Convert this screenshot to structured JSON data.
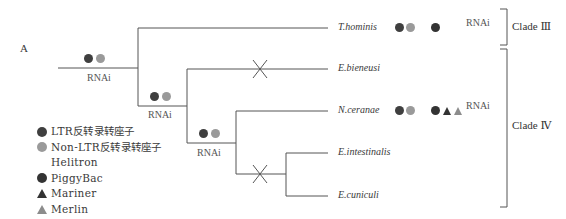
{
  "panel_label": "A",
  "colors": {
    "ltr": "#3f3f3f",
    "non_ltr": "#9a9a9a",
    "piggybac": "#333333",
    "mariner": "#333333",
    "merlin": "#8c8c8c",
    "line": "#555555"
  },
  "taxa": [
    {
      "name": "T.hominis",
      "markers": [
        "ltr",
        "non_ltr",
        "gap",
        "piggybac"
      ],
      "rnai": "RNAi"
    },
    {
      "name": "E.bieneusi",
      "markers": [],
      "rnai": ""
    },
    {
      "name": "N.ceranae",
      "markers": [
        "ltr",
        "non_ltr",
        "gap",
        "piggybac",
        "mariner",
        "merlin"
      ],
      "rnai": "RNAi"
    },
    {
      "name": "E.intestinalis",
      "markers": [],
      "rnai": ""
    },
    {
      "name": "E.cuniculi",
      "markers": [],
      "rnai": ""
    }
  ],
  "internal_nodes": [
    {
      "id": "root-stem",
      "markers": [
        "ltr",
        "non_ltr"
      ],
      "label": "RNAi"
    },
    {
      "id": "node-2",
      "markers": [
        "ltr",
        "non_ltr"
      ],
      "label": "RNAi"
    },
    {
      "id": "node-3",
      "markers": [
        "ltr",
        "non_ltr"
      ],
      "label": "RNAi"
    }
  ],
  "loss_marks": [
    "E.bieneusi branch",
    "E.intestinalis/E.cuniculi branch"
  ],
  "clades": [
    {
      "label": "Clade Ⅲ",
      "members": [
        "T.hominis"
      ]
    },
    {
      "label": "Clade Ⅳ",
      "members": [
        "E.bieneusi",
        "N.ceranae",
        "E.intestinalis",
        "E.cuniculi"
      ]
    }
  ],
  "legend": [
    {
      "symbol": "dot",
      "color_key": "ltr",
      "label": "LTR反转录转座子"
    },
    {
      "symbol": "dot",
      "color_key": "non_ltr",
      "label": "Non-LTR反转录转座子"
    },
    {
      "symbol": "none",
      "color_key": "",
      "label": "Helitron"
    },
    {
      "symbol": "dot",
      "color_key": "piggybac",
      "label": "PiggyBac"
    },
    {
      "symbol": "triangle",
      "color_key": "mariner",
      "label": "Mariner"
    },
    {
      "symbol": "triangle",
      "color_key": "merlin",
      "label": "Merlin"
    }
  ]
}
